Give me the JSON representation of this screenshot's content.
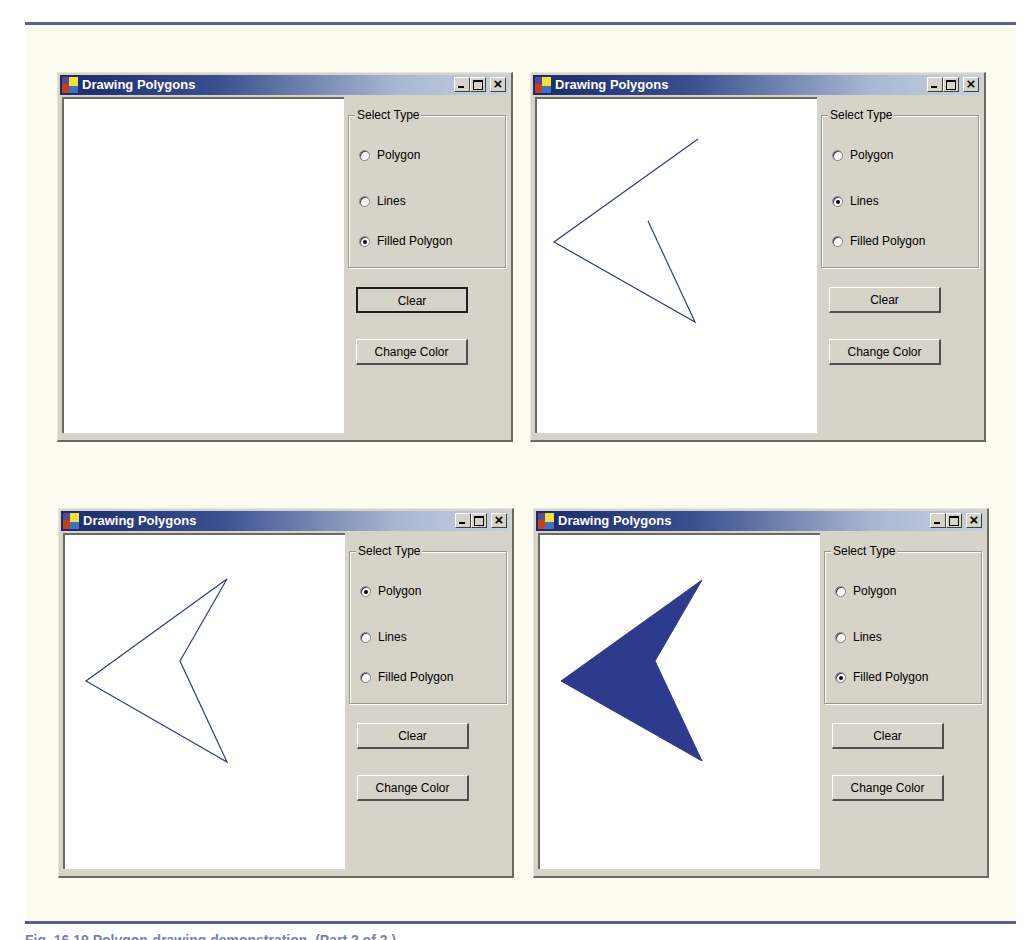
{
  "colors": {
    "titlebar_start": "#1b2a6c",
    "titlebar_end": "#c8d0dc",
    "drawing_color": "#2e3a8c",
    "rule_color": "#5a5f92"
  },
  "caption": "Fig. 16.19  Polygon-drawing demonstration. (Part 2 of 2.)",
  "windows": [
    {
      "title": "Drawing Polygons",
      "group_label": "Select Type",
      "options": [
        "Polygon",
        "Lines",
        "Filled Polygon"
      ],
      "selected": "Filled Polygon",
      "clear_label": "Clear",
      "change_color_label": "Change Color",
      "focused_button": "Clear",
      "drawing": {
        "mode": "none",
        "points": []
      }
    },
    {
      "title": "Drawing Polygons",
      "group_label": "Select Type",
      "options": [
        "Polygon",
        "Lines",
        "Filled Polygon"
      ],
      "selected": "Lines",
      "clear_label": "Clear",
      "change_color_label": "Change Color",
      "drawing": {
        "mode": "lines",
        "points": [
          [
            161,
            40
          ],
          [
            17,
            143
          ],
          [
            158,
            223
          ],
          [
            111,
            122
          ]
        ]
      }
    },
    {
      "title": "Drawing Polygons",
      "group_label": "Select Type",
      "options": [
        "Polygon",
        "Lines",
        "Filled Polygon"
      ],
      "selected": "Polygon",
      "clear_label": "Clear",
      "change_color_label": "Change Color",
      "drawing": {
        "mode": "polygon",
        "points": [
          [
            162,
            44
          ],
          [
            21,
            146
          ],
          [
            162,
            227
          ],
          [
            115,
            126
          ]
        ]
      }
    },
    {
      "title": "Drawing Polygons",
      "group_label": "Select Type",
      "options": [
        "Polygon",
        "Lines",
        "Filled Polygon"
      ],
      "selected": "Filled Polygon",
      "clear_label": "Clear",
      "change_color_label": "Change Color",
      "drawing": {
        "mode": "filled",
        "points": [
          [
            162,
            45
          ],
          [
            21,
            146
          ],
          [
            162,
            226
          ],
          [
            115,
            126
          ]
        ]
      }
    }
  ]
}
